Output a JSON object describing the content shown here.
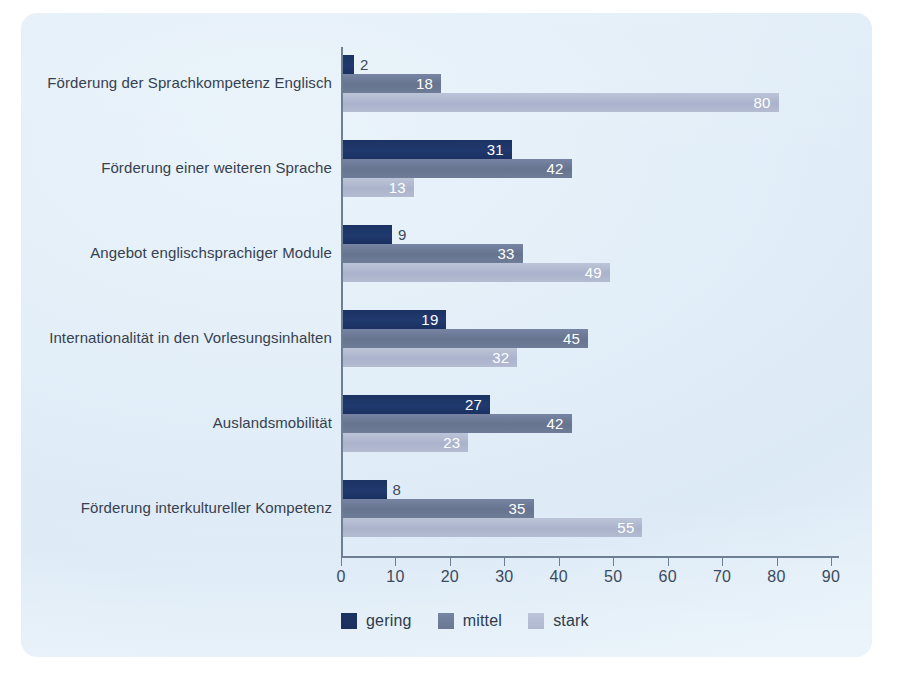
{
  "chart_data": {
    "type": "bar",
    "orientation": "horizontal",
    "title": "",
    "subtitle": "",
    "xlabel": "",
    "ylabel": "",
    "xlim": [
      0,
      90
    ],
    "xticks": [
      0,
      10,
      20,
      30,
      40,
      50,
      60,
      70,
      80,
      90
    ],
    "grid": false,
    "legend_position": "bottom-left",
    "categories": [
      "Förderung der Sprachkompetenz Englisch",
      "Förderung einer weiteren Sprache",
      "Angebot englischsprachiger Module",
      "Internationalität in den Vorlesungsinhalten",
      "Auslandsmobilität",
      "Förderung interkultureller Kompetenz"
    ],
    "series": [
      {
        "name": "gering",
        "color": "#1b3363",
        "values": [
          2,
          31,
          9,
          19,
          27,
          8
        ]
      },
      {
        "name": "mittel",
        "color": "#6b7891",
        "values": [
          18,
          42,
          33,
          45,
          42,
          35
        ]
      },
      {
        "name": "stark",
        "color": "#b0b8d0",
        "values": [
          80,
          13,
          49,
          32,
          23,
          55
        ]
      }
    ]
  },
  "legend": {
    "items": [
      {
        "label": "gering"
      },
      {
        "label": "mittel"
      },
      {
        "label": "stark"
      }
    ]
  },
  "axis": {
    "tick_labels": [
      "0",
      "10",
      "20",
      "30",
      "40",
      "50",
      "60",
      "70",
      "80",
      "90"
    ]
  }
}
